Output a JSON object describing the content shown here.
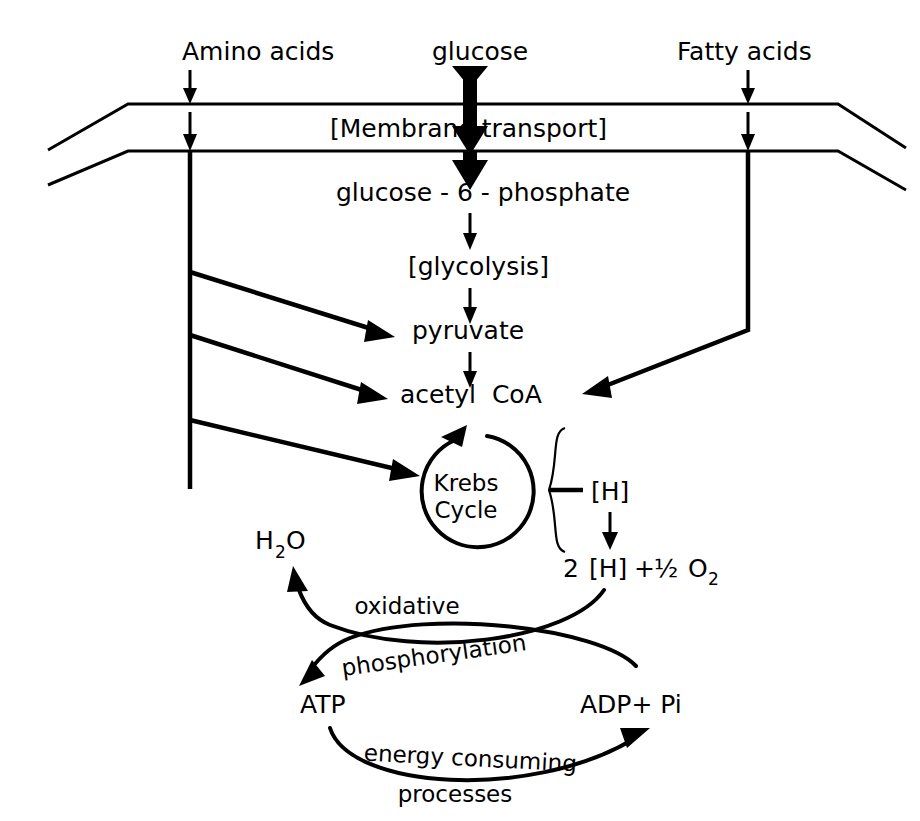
{
  "figure": {
    "background_color": "#ffffff",
    "ink_color": "#000000"
  },
  "inputs": {
    "amino_acids": "Amino acids",
    "glucose": "glucose",
    "fatty_acids": "Fatty acids"
  },
  "membrane": {
    "label": "[Membrane transport]"
  },
  "glycolysis_path": {
    "g6p": "glucose - 6 - phosphate",
    "glycolysis": "[glycolysis]",
    "pyruvate": "pyruvate",
    "acetyl_coa": "acetyl  CoA"
  },
  "krebs": {
    "line1": "Krebs",
    "line2": "Cycle"
  },
  "reducing_equivalents": {
    "h_bracket": "[H]",
    "two_h_plus_half_o2": {
      "coefficient": "2",
      "h_bracket": "[H]",
      "plus": "+",
      "fraction": "½",
      "oxygen": "O",
      "oxygen_subscript": "2"
    }
  },
  "oxidative_phosphorylation": {
    "water": {
      "h": "H",
      "subscript": "2",
      "o": "O"
    },
    "label_line1": "oxidative",
    "label_line2": "phosphorylation",
    "atp": "ATP",
    "adp_pi": "ADP+ Pi"
  },
  "energy_consuming": {
    "label_line1": "energy consuming",
    "label_line2": "processes"
  }
}
